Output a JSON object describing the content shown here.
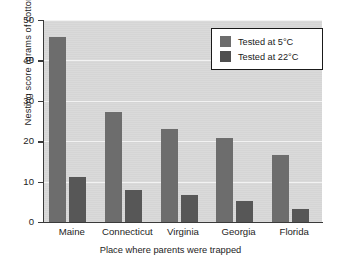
{
  "chart_data": {
    "type": "bar",
    "title": "",
    "xlabel": "Place where parents were trapped",
    "ylabel": "Nesting score (grams of cotton)",
    "categories": [
      "Maine",
      "Connecticut",
      "Virginia",
      "Georgia",
      "Florida"
    ],
    "series": [
      {
        "name": "Tested at 5°C",
        "values": [
          45.8,
          27.3,
          23.0,
          20.7,
          16.5
        ],
        "color": "#6d6d6d"
      },
      {
        "name": "Tested at 22°C",
        "values": [
          11.2,
          7.8,
          6.7,
          5.3,
          3.2
        ],
        "color": "#575757"
      }
    ],
    "ylim": [
      0,
      50
    ],
    "yticks": [
      0,
      10,
      20,
      30,
      40,
      50
    ],
    "ytick_labels": [
      "0",
      "10",
      "20",
      "30",
      "40",
      "50"
    ],
    "grid": true,
    "grid_axis": "y",
    "legend_position": "top-right",
    "plot_background": "#d8d8d8",
    "figure_background": "#ffffff"
  },
  "legend": {
    "items": [
      {
        "label": "Tested at 5°C"
      },
      {
        "label": "Tested at 22°C"
      }
    ]
  }
}
